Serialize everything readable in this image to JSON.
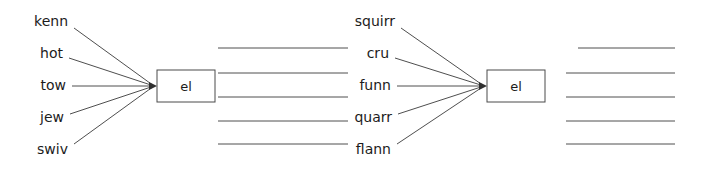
{
  "diagram": {
    "title": "",
    "background_color": "#ffffff",
    "line_color": "#3a3a3a",
    "text_color": "#1c1c1c",
    "units": [
      {
        "id": "unit-left",
        "node": {
          "label": "el",
          "x": 157,
          "y": 70,
          "width": 58,
          "height": 32
        },
        "converge": {
          "x": 157,
          "y": 86
        },
        "inputs": [
          {
            "label": "kenn",
            "text_x": 68,
            "text_y": 22,
            "line_x": 74,
            "line_y": 28
          },
          {
            "label": "hot",
            "text_x": 63,
            "text_y": 54,
            "line_x": 69,
            "line_y": 58
          },
          {
            "label": "tow",
            "text_x": 66,
            "text_y": 86,
            "line_x": 72,
            "line_y": 86
          },
          {
            "label": "jew",
            "text_x": 64,
            "text_y": 118,
            "line_x": 70,
            "line_y": 114
          },
          {
            "label": "swiv",
            "text_x": 68,
            "text_y": 150,
            "line_x": 74,
            "line_y": 144
          }
        ],
        "outputs": [
          {
            "x1": 218,
            "y1": 48,
            "x2": 348,
            "y2": 48
          },
          {
            "x1": 218,
            "y1": 73,
            "x2": 348,
            "y2": 73
          },
          {
            "x1": 218,
            "y1": 97,
            "x2": 348,
            "y2": 97
          },
          {
            "x1": 218,
            "y1": 121,
            "x2": 348,
            "y2": 121
          },
          {
            "x1": 218,
            "y1": 144,
            "x2": 348,
            "y2": 144
          }
        ]
      },
      {
        "id": "unit-right",
        "node": {
          "label": "el",
          "x": 487,
          "y": 70,
          "width": 58,
          "height": 32
        },
        "converge": {
          "x": 487,
          "y": 86
        },
        "inputs": [
          {
            "label": "squirr",
            "text_x": 395,
            "text_y": 22,
            "line_x": 401,
            "line_y": 28
          },
          {
            "label": "cru",
            "text_x": 389,
            "text_y": 54,
            "line_x": 395,
            "line_y": 58
          },
          {
            "label": "funn",
            "text_x": 391,
            "text_y": 86,
            "line_x": 397,
            "line_y": 86
          },
          {
            "label": "quarr",
            "text_x": 392,
            "text_y": 118,
            "line_x": 398,
            "line_y": 114
          },
          {
            "label": "flann",
            "text_x": 391,
            "text_y": 150,
            "line_x": 397,
            "line_y": 144
          }
        ],
        "outputs": [
          {
            "x1": 578,
            "y1": 48,
            "x2": 675,
            "y2": 48
          },
          {
            "x1": 566,
            "y1": 73,
            "x2": 675,
            "y2": 73
          },
          {
            "x1": 566,
            "y1": 97,
            "x2": 675,
            "y2": 97
          },
          {
            "x1": 566,
            "y1": 121,
            "x2": 675,
            "y2": 121
          },
          {
            "x1": 566,
            "y1": 144,
            "x2": 675,
            "y2": 144
          }
        ]
      }
    ]
  }
}
